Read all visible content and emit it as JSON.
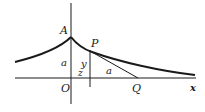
{
  "diagram": {
    "type": "tractrix",
    "colors": {
      "ink": "#1a1a1a",
      "background": "#ffffff"
    },
    "labels": {
      "cusp": "A",
      "point": "P",
      "origin": "O",
      "tangent_foot": "Q",
      "x_axis": "x",
      "height_left": "a",
      "ordinate": "y",
      "abscissa": "z",
      "tangent_length": "a"
    }
  }
}
